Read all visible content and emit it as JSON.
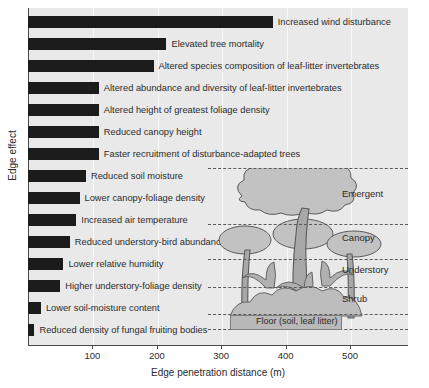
{
  "chart_data": {
    "type": "bar",
    "orientation": "horizontal",
    "title": "",
    "xlabel": "Edge penetration distance (m)",
    "ylabel": "Edge effect",
    "xlim": [
      0,
      590
    ],
    "xticks": [
      100,
      200,
      300,
      400,
      500
    ],
    "xtick_labels": [
      "100",
      "200",
      "300",
      "400",
      "500"
    ],
    "grid": "vertical",
    "legend": "none",
    "units": "m",
    "bar_color": "#1c1c1c",
    "categories": [
      "Increased wind disturbance",
      "Elevated tree mortality",
      "Altered species composition of leaf-litter invertebrates",
      "Altered abundance and diversity of leaf-litter invertebrates",
      "Altered height of greatest foliage density",
      "Reduced canopy height",
      "Faster recruitment of disturbance-adapted trees",
      "Reduced soil moisture",
      "Lower canopy-foliage density",
      "Increased air temperature",
      "Reduced understory-bird abundance",
      "Lower relative humidity",
      "Higher understory-foliage density",
      "Lower soil-moisture content",
      "Reduced density of fungal fruiting bodies"
    ],
    "values": [
      380,
      215,
      195,
      110,
      110,
      110,
      110,
      90,
      80,
      75,
      65,
      55,
      50,
      20,
      10
    ]
  },
  "axis": {
    "x_title": "Edge penetration distance (m)",
    "y_title": "Edge effect"
  },
  "inset": {
    "name": "forest-strata-diagram",
    "strata": [
      {
        "label": "Emergent"
      },
      {
        "label": "Canopy"
      },
      {
        "label": "Understory"
      },
      {
        "label": "Shrub"
      }
    ],
    "floor_label": "Floor (soil, leaf litter)"
  }
}
